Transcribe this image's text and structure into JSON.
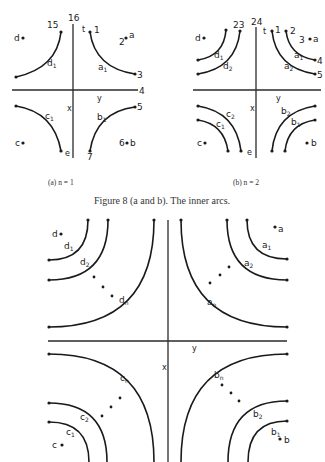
{
  "figure_a": {
    "caption": "(a) n = 1",
    "top_label": "16",
    "t_label": "t",
    "right_label": "4",
    "y_label": "y",
    "x_label": "x",
    "points": {
      "d": "d",
      "c": "c",
      "b": "b",
      "a": "a",
      "e": "e"
    },
    "nums": {
      "n1": "1",
      "n2": "2",
      "n3": "3",
      "n5": "5",
      "n6": "6",
      "n7": "7",
      "n15": "15"
    },
    "arcs": {
      "a1": "a",
      "b1": "b",
      "c1": "c",
      "d1": "d",
      "sub": "1"
    }
  },
  "figure_b": {
    "caption": "(b) n = 2",
    "top_label": "24",
    "t_label": "t",
    "y_label": "y",
    "x_label": "x",
    "points": {
      "d": "d",
      "c": "c",
      "b": "b",
      "a": "a",
      "e": "e"
    },
    "nums": {
      "n1": "1",
      "n2": "2",
      "n3": "3",
      "n4": "4",
      "n5": "5",
      "n23": "23"
    },
    "arcs": {
      "a": "a",
      "b": "b",
      "c": "c",
      "d": "d",
      "s1": "1",
      "s2": "2"
    }
  },
  "caption": "Figure 8 (a and b).  The inner arcs.",
  "figure_main": {
    "y_label": "y",
    "x_label": "x",
    "points": {
      "a": "a",
      "b": "b",
      "c": "c",
      "d": "d"
    },
    "arcs": {
      "a": "a",
      "b": "b",
      "c": "c",
      "d": "d",
      "s1": "1",
      "s2": "2",
      "sn": "n"
    }
  }
}
